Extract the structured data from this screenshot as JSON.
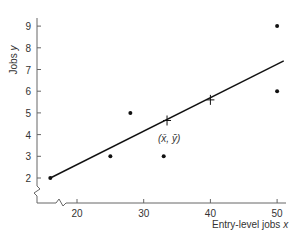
{
  "chart_data": {
    "type": "scatter",
    "title": "",
    "xlabel": "Entry-level jobs",
    "xlabel_var": "x",
    "ylabel": "Jobs",
    "ylabel_var": "y",
    "x_ticks": [
      20,
      30,
      40,
      50
    ],
    "y_ticks": [
      2,
      3,
      4,
      5,
      6,
      7,
      8,
      9
    ],
    "xlim": [
      15,
      52
    ],
    "ylim": [
      1,
      9.5
    ],
    "axis_breaks": true,
    "grid": false,
    "points": [
      {
        "x": 16,
        "y": 2
      },
      {
        "x": 25,
        "y": 3
      },
      {
        "x": 28,
        "y": 5
      },
      {
        "x": 33,
        "y": 3
      },
      {
        "x": 50,
        "y": 6
      },
      {
        "x": 50,
        "y": 9
      }
    ],
    "regression_line": {
      "x_start": 16,
      "y_start": 2,
      "x_end": 51,
      "y_end": 7.4
    },
    "markers": [
      {
        "x": 33.5,
        "y": 4.65,
        "label": "(x̄, ȳ)",
        "symbol": "cross"
      },
      {
        "x": 40,
        "y": 5.6,
        "label": "",
        "symbol": "cross"
      }
    ],
    "annotation": "(x̄, ȳ)"
  }
}
